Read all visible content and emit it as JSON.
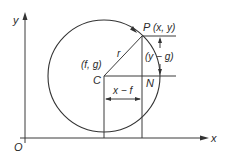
{
  "diagram": {
    "colors": {
      "stroke": "#333333",
      "background": "#ffffff",
      "text": "#2a2a2a"
    },
    "axes": {
      "x_label": "x",
      "y_label": "y",
      "origin_label": "O"
    },
    "points": {
      "centre_label": "C",
      "centre_coords": "(f, g)",
      "point_label": "P",
      "point_coords": "(x, y)",
      "foot_label": "N"
    },
    "segments": {
      "radius_label": "r",
      "horizontal_label": "x − f",
      "vertical_label": "(y − g)"
    },
    "geometry": {
      "circle": {
        "cx": 104,
        "cy": 76,
        "r": 56
      },
      "centre": {
        "x": 104,
        "y": 76
      },
      "point_P": {
        "x": 142,
        "y": 36
      },
      "point_N": {
        "x": 142,
        "y": 76
      },
      "origin": {
        "x": 25,
        "y": 138
      }
    }
  }
}
